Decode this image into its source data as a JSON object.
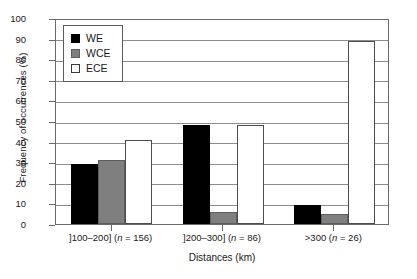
{
  "chart_data": {
    "type": "bar",
    "title": "",
    "xlabel": "Distances (km)",
    "ylabel": "Frequency of occurrences (%)",
    "ylim": [
      0,
      100
    ],
    "ytick_step": 10,
    "yticks": [
      0,
      10,
      20,
      30,
      40,
      50,
      60,
      70,
      80,
      90,
      100
    ],
    "grid": "horizontal",
    "legend_position": "top-left-inside",
    "categories": [
      "]100–200] (n = 156)",
      "]200–300] (n = 86)",
      ">300 (n = 26)"
    ],
    "category_parts": [
      {
        "range": "]100–200] (",
        "n_symbol": "n",
        "count": " = 156)"
      },
      {
        "range": "]200–300] (",
        "n_symbol": "n",
        "count": " = 86)"
      },
      {
        "range": ">300 (",
        "n_symbol": "n",
        "count": " = 26)"
      }
    ],
    "series": [
      {
        "name": "WE",
        "color": "#000000",
        "values": [
          29,
          48,
          9
        ]
      },
      {
        "name": "WCE",
        "color": "#7f7f7f",
        "values": [
          31,
          6,
          5
        ]
      },
      {
        "name": "ECE",
        "color": "#ffffff",
        "values": [
          41,
          48,
          89
        ]
      }
    ]
  },
  "legend": {
    "items": [
      {
        "label": "WE"
      },
      {
        "label": "WCE"
      },
      {
        "label": "ECE"
      }
    ]
  },
  "axes": {
    "y_title": "Frequency of occurrences (%)",
    "x_title": "Distances (km)"
  }
}
